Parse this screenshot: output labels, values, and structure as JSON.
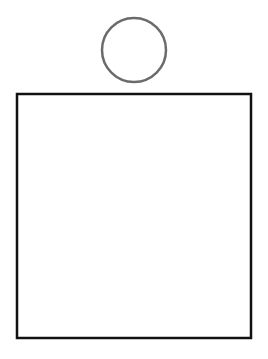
{
  "diagram": {
    "background": "#ffffff",
    "shapes": [
      {
        "type": "circle",
        "name": "head-circle",
        "cx": 134,
        "cy": 50,
        "r": 32,
        "stroke": "#6b6b6b",
        "stroke_width": 2.5,
        "fill": "none"
      },
      {
        "type": "rect",
        "name": "body-rectangle",
        "x": 17,
        "y": 94,
        "width": 234,
        "height": 244,
        "stroke": "#111111",
        "stroke_width": 2.5,
        "fill": "none"
      }
    ]
  }
}
